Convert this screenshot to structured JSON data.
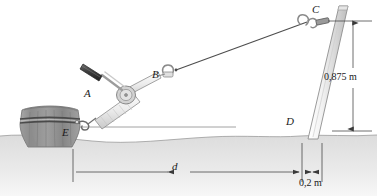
{
  "figure": {
    "type": "engineering-statics-diagram",
    "labels": {
      "A": "A",
      "B": "B",
      "C": "C",
      "D": "D",
      "E": "E",
      "d": "d"
    },
    "dimensions": {
      "height": "0,875 m",
      "offset": "0,2 m",
      "span": "d"
    },
    "parts": {
      "stump": "tree-stump",
      "chain": "chain-band",
      "hook": "hook-at-E",
      "winch": "come-along-winch",
      "handle": "winch-handle-grip",
      "drum": "winch-drum",
      "shackle_b": "shackle-connector-B",
      "cable": "cable-BC",
      "shackle_c": "shackle-connector-C",
      "post": "leaning-post",
      "ground": "ground-terrain",
      "baseline": "horizontal-reference-line"
    },
    "colors": {
      "ink": "#2b2b2b",
      "line": "#555555",
      "stump_dark": "#6e6e6e",
      "stump_light": "#9a9a9a",
      "metal_light": "#e9e9e9",
      "metal_mid": "#c4c4c4",
      "handle_dark": "#4a4a4a",
      "ground_fill": "#d9d9d9",
      "dim_line": "#4a4a4a"
    }
  }
}
